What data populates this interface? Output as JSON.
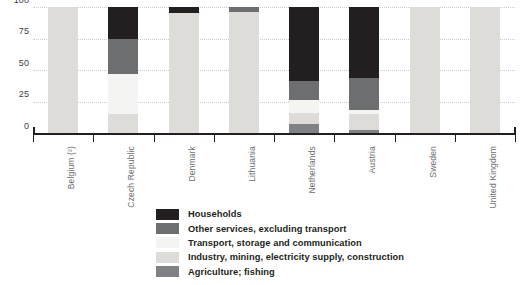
{
  "chart_data": {
    "type": "bar",
    "stacked": true,
    "orientation": "vertical",
    "title": "",
    "subtitle": "",
    "xlabel": "",
    "ylabel": "",
    "ylim": [
      0,
      100
    ],
    "yticks": [
      0,
      25,
      50,
      75,
      100
    ],
    "ytick_labels": [
      "0",
      "25",
      "50",
      "75",
      "100"
    ],
    "grid": true,
    "grid_axis": "y",
    "grid_style": "dotted",
    "legend_position": "bottom-center",
    "units": "%",
    "categories": [
      "Belgium (²)",
      "Czech Republic",
      "Denmark",
      "Lithuania",
      "Netherlands",
      "Austria",
      "Sweden",
      "United Kingdom"
    ],
    "series": [
      {
        "name": "Households",
        "color": "#231f20",
        "values": [
          0,
          25,
          5,
          0,
          59,
          56,
          0,
          0
        ]
      },
      {
        "name": "Other services, excluding transport",
        "color": "#6d6e70",
        "values": [
          0,
          28,
          0,
          4,
          15,
          26,
          0,
          0
        ]
      },
      {
        "name": "Transport, storage and communication",
        "color": "#f4f4f2",
        "values": [
          0,
          32,
          0,
          0,
          10,
          3,
          0,
          0
        ]
      },
      {
        "name": "Industry, mining, electricity supply, construction",
        "color": "#dddcd8",
        "values": [
          100,
          15,
          95,
          96,
          9,
          13,
          100,
          100
        ]
      },
      {
        "name": "Agriculture; fishing",
        "color": "#808184",
        "values": [
          0,
          0,
          0,
          0,
          7,
          2,
          0,
          0
        ]
      }
    ],
    "stack_order_bottom_to_top": [
      "Agriculture; fishing",
      "Industry, mining, electricity supply, construction",
      "Transport, storage and communication",
      "Other services, excluding transport",
      "Households"
    ],
    "legend": [
      {
        "label": "Households",
        "color": "#231f20"
      },
      {
        "label": "Other services, excluding transport",
        "color": "#6d6e70"
      },
      {
        "label": "Transport, storage and communication",
        "color": "#f4f4f2"
      },
      {
        "label": "Industry, mining, electricity supply, construction",
        "color": "#dddcd8"
      },
      {
        "label": "Agriculture; fishing",
        "color": "#808184"
      }
    ],
    "colors": {
      "axis": "#231f20",
      "gridline": "#c9cdd6",
      "tick_label": "#414042",
      "category_label": "#6d6e70",
      "background": "#ffffff"
    }
  }
}
